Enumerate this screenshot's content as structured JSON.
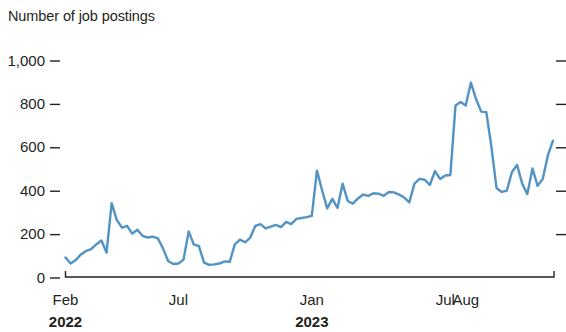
{
  "chart_data": {
    "type": "line",
    "title": "Number of job postings",
    "xlabel": "",
    "ylabel": "Number of job postings",
    "ylim": [
      0,
      1000
    ],
    "yticks": [
      0,
      200,
      400,
      600,
      800,
      1000
    ],
    "ytick_labels": [
      "0",
      "200",
      "400",
      "600",
      "800",
      "1,000"
    ],
    "xtick_labels": [
      "Feb",
      "Jul",
      "Jan",
      "Jul",
      "Aug"
    ],
    "xtick_sublabels": [
      "2022",
      "",
      "2023",
      "",
      ""
    ],
    "xtick_positions": [
      0,
      22,
      48,
      74,
      78
    ],
    "grid": false,
    "legend": "none",
    "line_color": "#5193c4",
    "series": [
      {
        "name": "Job postings",
        "values": [
          90,
          62,
          78,
          104,
          120,
          128,
          150,
          168,
          112,
          340,
          262,
          228,
          236,
          200,
          218,
          190,
          182,
          186,
          178,
          132,
          74,
          60,
          62,
          80,
          210,
          150,
          142,
          66,
          56,
          58,
          62,
          72,
          70,
          150,
          172,
          160,
          182,
          236,
          244,
          224,
          232,
          240,
          230,
          254,
          244,
          268,
          272,
          276,
          282,
          490,
          400,
          316,
          360,
          318,
          430,
          350,
          338,
          362,
          380,
          374,
          386,
          384,
          374,
          392,
          390,
          380,
          366,
          344,
          430,
          452,
          448,
          424,
          488,
          452,
          468,
          470,
          790,
          806,
          790,
          896,
          820,
          762,
          760,
          600,
          410,
          392,
          398,
          484,
          516,
          430,
          382,
          500,
          420,
          452,
          560,
          628
        ]
      }
    ]
  },
  "axes": {
    "y_axis_title": "Number of job postings"
  }
}
